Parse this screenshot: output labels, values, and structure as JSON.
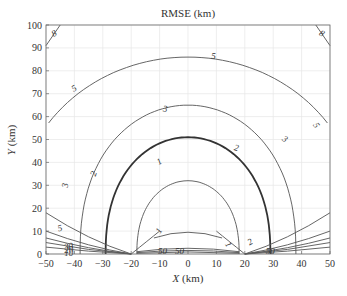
{
  "chart_data": {
    "type": "contour",
    "title": "RMSE  (km)",
    "xlabel": "X (km)",
    "ylabel": "Y (km)",
    "xlim": [
      -50,
      50
    ],
    "ylim": [
      0,
      100
    ],
    "xticks": [
      -50,
      -40,
      -30,
      -20,
      -10,
      0,
      10,
      20,
      30,
      40,
      50
    ],
    "yticks": [
      0,
      10,
      20,
      30,
      40,
      50,
      60,
      70,
      80,
      90,
      100
    ],
    "grid": true,
    "sensors_x": [
      -20,
      20
    ],
    "contour_levels": [
      1,
      2,
      3,
      5,
      8,
      10,
      20,
      30,
      50
    ],
    "contours": [
      {
        "level": 1,
        "peak_y": 32,
        "x_extent": [
          -18,
          18
        ],
        "labels": [
          "1",
          "1",
          "1"
        ]
      },
      {
        "level": 2,
        "peak_y": 51,
        "x_extent": [
          -29,
          29
        ],
        "labels": [
          "2",
          "2",
          "2"
        ],
        "emphasized": true
      },
      {
        "level": 3,
        "peak_y": 65,
        "x_extent": [
          -38,
          38
        ],
        "labels": [
          "3",
          "3",
          "3"
        ]
      },
      {
        "level": 5,
        "peak_y": 86,
        "x_extent": [
          -50,
          50
        ],
        "labels": [
          "5",
          "5",
          "5",
          "5"
        ]
      },
      {
        "level": 8,
        "corner_points": [
          [
            -50,
            91
          ],
          [
            -45,
            100
          ],
          [
            45,
            100
          ],
          [
            50,
            91
          ]
        ],
        "labels": [
          "8",
          "8"
        ]
      }
    ],
    "near_baseline_labels": [
      "30",
      "20",
      "10",
      "50",
      "50",
      "50"
    ]
  },
  "labels": {
    "title": "RMSE  (km)",
    "xlabel_var": "X",
    "xlabel_unit": " (km)",
    "ylabel_var": "Y",
    "ylabel_unit": " (km)"
  }
}
